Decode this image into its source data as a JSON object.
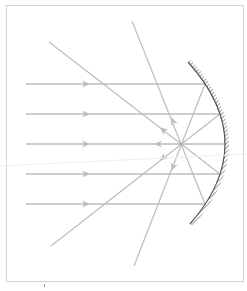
{
  "diagram": {
    "colors": {
      "ray": "#bdbdbd",
      "mirror": "#555555",
      "frame": "#d4d4d4",
      "background": "#ffffff"
    },
    "focus": {
      "x": 181,
      "y": 144
    },
    "mirror": {
      "top": {
        "x": 188,
        "y": 62
      },
      "apex": {
        "x": 224,
        "y": 144
      },
      "bottom": {
        "x": 190,
        "y": 224
      }
    },
    "parallel_rays": [
      {
        "y": 84,
        "hit_x": 205
      },
      {
        "y": 114,
        "hit_x": 220
      },
      {
        "y": 144,
        "hit_x": 225
      },
      {
        "y": 174,
        "hit_x": 220
      },
      {
        "y": 204,
        "hit_x": 205
      }
    ],
    "oblique_rays": [
      {
        "from": [
          49,
          42
        ],
        "to": [
          220,
          174
        ]
      },
      {
        "from": [
          132,
          21
        ],
        "to": [
          205,
          204
        ]
      },
      {
        "from": [
          51,
          246
        ],
        "to": [
          220,
          114
        ]
      },
      {
        "from": [
          134,
          266
        ],
        "to": [
          205,
          84
        ]
      }
    ]
  }
}
